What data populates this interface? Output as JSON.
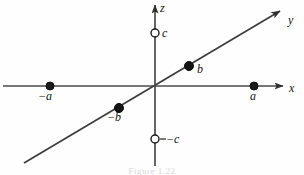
{
  "figure": {
    "caption": "Figure 1.22",
    "background_color": "#fefefe",
    "line_color": "#3a3a3a",
    "ink_color": "#141414",
    "marker_fill_color": "#1a1a1a",
    "marker_hollow_fill": "#ffffff"
  },
  "axes": [
    {
      "id": "x",
      "label": "x",
      "label_x": 289,
      "label_y": 90,
      "x1": 3,
      "y1": 86,
      "x2": 283,
      "y2": 86,
      "arrow": "end"
    },
    {
      "id": "y",
      "label": "y",
      "label_x": 291,
      "label_y": 16,
      "x1": 24,
      "y1": 163,
      "x2": 280,
      "y2": 11,
      "arrow": "end"
    },
    {
      "id": "z",
      "label": "z",
      "label_x": 161,
      "label_y": 4,
      "x1": 155,
      "y1": 166,
      "x2": 155,
      "y2": 5,
      "arrow": "end"
    }
  ],
  "origin": {
    "x": 155,
    "y": 86
  },
  "points": [
    {
      "id": "minus-a",
      "label": "−a",
      "axis": "x",
      "style": "filled",
      "cx": 50,
      "cy": 86,
      "r": 4,
      "label_x": 41,
      "label_y": 93
    },
    {
      "id": "a",
      "label": "a",
      "axis": "x",
      "style": "filled",
      "cx": 254,
      "cy": 86,
      "r": 4,
      "label_x": 251,
      "label_y": 93
    },
    {
      "id": "b",
      "label": "b",
      "axis": "y",
      "style": "filled",
      "cx": 189,
      "cy": 66,
      "r": 4.5,
      "label_x": 198,
      "label_y": 68
    },
    {
      "id": "minus-b",
      "label": "−b",
      "axis": "y",
      "style": "filled",
      "cx": 119,
      "cy": 108,
      "r": 4.5,
      "label_x": 110,
      "label_y": 114
    },
    {
      "id": "c",
      "label": "c",
      "axis": "z",
      "style": "hollow",
      "cx": 155,
      "cy": 33,
      "r": 4,
      "label_x": 163,
      "label_y": 29
    },
    {
      "id": "minus-c",
      "label": "−c",
      "axis": "z",
      "style": "hollow",
      "cx": 155,
      "cy": 139,
      "r": 4,
      "label_x": 163,
      "label_y": 135
    }
  ]
}
